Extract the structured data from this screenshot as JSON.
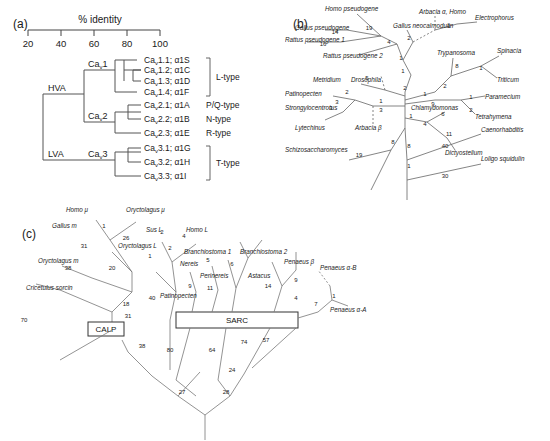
{
  "figure": {
    "panels": [
      "(a)",
      "(b)",
      "(c)"
    ]
  },
  "panel_a": {
    "label": "(a)",
    "axis_title": "% identity",
    "ticks": [
      "20",
      "40",
      "60",
      "80",
      "100"
    ],
    "group_labels": {
      "hva": "HVA",
      "lva": "LVA",
      "cav1": "Ca",
      "cav1_sub": "v",
      "cav1_num": "1",
      "cav2_num": "2",
      "cav3_num": "3"
    },
    "leaves": [
      {
        "name": "Ca",
        "sub": "v",
        "rest": "1.1; α1S"
      },
      {
        "name": "Ca",
        "sub": "v",
        "rest": "1.2; α1C"
      },
      {
        "name": "Ca",
        "sub": "v",
        "rest": "1.3; α1D"
      },
      {
        "name": "Ca",
        "sub": "v",
        "rest": "1.4; α1F"
      },
      {
        "name": "Ca",
        "sub": "v",
        "rest": "2.1; α1A"
      },
      {
        "name": "Ca",
        "sub": "v",
        "rest": "2.2; α1B"
      },
      {
        "name": "Ca",
        "sub": "v",
        "rest": "2.3; α1E"
      },
      {
        "name": "Ca",
        "sub": "v",
        "rest": "3.1; α1G"
      },
      {
        "name": "Ca",
        "sub": "v",
        "rest": "3.2; α1H"
      },
      {
        "name": "Ca",
        "sub": "v",
        "rest": "3.3; α1I"
      }
    ],
    "channel_types": [
      "L-type",
      "P/Q-type",
      "N-type",
      "R-type",
      "T-type"
    ]
  },
  "panel_b": {
    "label": "(b)",
    "taxa": [
      "Homo pseudogene",
      "Gallus pseudogene",
      "Rattus pseudogene 1",
      "Rattus pseudogene 2",
      "Gallus neocalmodulin",
      "Arbacia α, Homo",
      "Electrophorus",
      "Trypanosoma",
      "Spinacia",
      "Triticum",
      "Paramecium",
      "Tetrahymena",
      "Chlamydomonas",
      "Dictyostelium",
      "Caenorhabditis",
      "Loligo squidulin",
      "Metridium",
      "Drosophila",
      "Patinopecten",
      "Strongylocentrotus",
      "Lytechinus",
      "Arbacia β",
      "Schizosaccharomyces"
    ],
    "branch_numbers": [
      "19",
      "14",
      "16",
      "4",
      "2",
      "1",
      "1",
      "1",
      "5",
      "2",
      "2",
      "3",
      "1",
      "2",
      "1",
      "8",
      "9",
      "1",
      "6",
      "2",
      "3",
      "11",
      "4",
      "8",
      "8",
      "19",
      "40",
      "30",
      "1",
      "1",
      "3",
      "1"
    ]
  },
  "panel_c": {
    "label": "(c)",
    "taxa": [
      "Homo μ",
      "Oryctolagus μ",
      "Gallus m",
      "Oryctolagus m",
      "Cricetulus sorcin",
      "Sus L",
      "Homo L",
      "Oryctolagus L",
      "Branchiostoma 1",
      "Branchiostoma 2",
      "Nereis",
      "Perinereis",
      "Patinopecten",
      "Astacus",
      "Penaeus β",
      "Penaeus α-B",
      "Penaeus α-A"
    ],
    "boxes": [
      "SARC",
      "CALP"
    ],
    "branch_numbers": [
      "1",
      "26",
      "31",
      "20",
      "38",
      "70",
      "18",
      "40",
      "2",
      "4",
      "2",
      "1",
      "5",
      "6",
      "9",
      "11",
      "14",
      "9",
      "4",
      "7",
      "1",
      "31",
      "38",
      "80",
      "64",
      "74",
      "57",
      "24",
      "27",
      "28"
    ]
  }
}
